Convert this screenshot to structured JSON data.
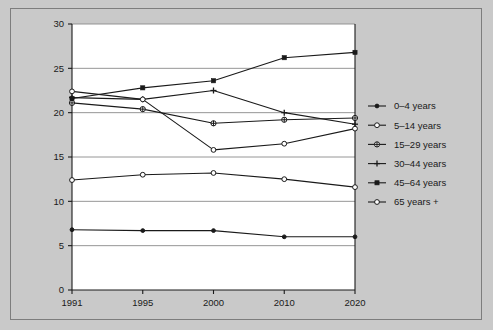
{
  "chart_data": {
    "type": "line",
    "title": "",
    "subtitle": "",
    "xlabel": "",
    "ylabel": "",
    "categories": [
      "1991",
      "1995",
      "2000",
      "2010",
      "2020"
    ],
    "ylim": [
      0,
      30
    ],
    "yticks": [
      0,
      5,
      10,
      15,
      20,
      25,
      30
    ],
    "grid": "horizontal",
    "legend_position": "right",
    "series": [
      {
        "name": "0–4 years",
        "marker": "filled-circle-small",
        "values": [
          6.8,
          6.7,
          6.7,
          6.0,
          6.0
        ]
      },
      {
        "name": "5–14 years",
        "marker": "open-circle",
        "values": [
          12.4,
          13.0,
          13.2,
          12.5,
          11.6
        ]
      },
      {
        "name": "15–29 years",
        "marker": "open-circle-cross",
        "values": [
          21.1,
          20.4,
          18.8,
          19.2,
          19.4
        ]
      },
      {
        "name": "30–44 years",
        "marker": "plus-cross",
        "values": [
          21.7,
          21.5,
          22.5,
          20.0,
          18.7
        ]
      },
      {
        "name": "45–64 years",
        "marker": "filled-diamond",
        "values": [
          21.6,
          22.8,
          23.6,
          26.2,
          26.8
        ]
      },
      {
        "name": "65 years +",
        "marker": "open-circle",
        "values": [
          22.4,
          21.5,
          15.8,
          16.5,
          18.2
        ]
      }
    ],
    "colors": {
      "line": "#1a1a1a",
      "grid": "#8a8a8a",
      "axis": "#1a1a1a",
      "background": "#ffffff",
      "page_background": "#c9c9c9",
      "frame_border": "#7d7d7d",
      "text": "#1a1a1a"
    }
  },
  "legend": {
    "items": [
      {
        "label": "0–4 years"
      },
      {
        "label": "5–14 years"
      },
      {
        "label": "15–29 years"
      },
      {
        "label": "30–44 years"
      },
      {
        "label": "45–64 years"
      },
      {
        "label": "65 years +"
      }
    ]
  },
  "axes": {
    "y_tick_labels": [
      "0",
      "5",
      "10",
      "15",
      "20",
      "25",
      "30"
    ],
    "x_tick_labels": [
      "1991",
      "1995",
      "2000",
      "2010",
      "2020"
    ]
  }
}
